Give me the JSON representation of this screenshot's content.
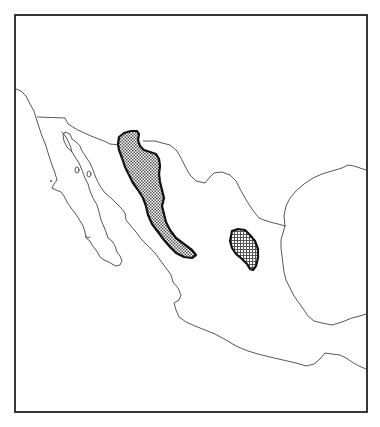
{
  "map": {
    "subject": "Mexico",
    "frame": {
      "x": 15,
      "y": 15,
      "width": 352,
      "height": 397,
      "stroke": "#222222"
    },
    "line_color": "#444444",
    "background": "#ffffff",
    "labels": [],
    "features": [
      {
        "id": "us-mexico-border",
        "type": "international-border"
      },
      {
        "id": "baja-california-peninsula",
        "type": "coastline"
      },
      {
        "id": "gulf-of-california",
        "type": "water-body"
      },
      {
        "id": "pacific-coast",
        "type": "coastline"
      },
      {
        "id": "gulf-of-mexico-coast",
        "type": "coastline"
      },
      {
        "id": "yucatan-peninsula-edge",
        "type": "coastline"
      },
      {
        "id": "gulf-islands",
        "type": "islands"
      }
    ],
    "range_areas": [
      {
        "id": "range-sierra-madre-occidental",
        "description": "Elongated stippled distribution area along the Sierra Madre Occidental, from the US border southeast",
        "fill_pattern": "dot-stipple",
        "fill_color": "#555555",
        "outline_color": "#111111"
      },
      {
        "id": "range-central-plateau",
        "description": "Small isolated stippled distribution area in the central / east-central highlands",
        "fill_pattern": "cross-hatch",
        "fill_color": "#555555",
        "outline_color": "#111111"
      }
    ]
  }
}
